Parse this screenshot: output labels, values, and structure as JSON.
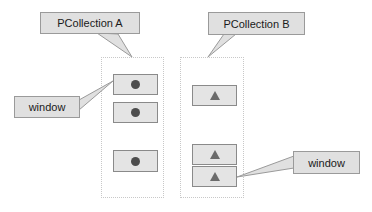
{
  "diagram": {
    "colors": {
      "callout_fill": "#e0e0e0",
      "callout_stroke": "#9a9a9a",
      "element_fill": "#e4e4e4",
      "element_stroke": "#8a8a8a",
      "container_stroke": "#c8c8c8",
      "circle_fill": "#4d4d4d",
      "triangle_fill": "#6b6b6b",
      "background": "#ffffff"
    },
    "callouts": [
      {
        "id": "pcollection-a",
        "label": "PCollection A"
      },
      {
        "id": "pcollection-b",
        "label": "PCollection B"
      },
      {
        "id": "window-left",
        "label": "window"
      },
      {
        "id": "window-right",
        "label": "window"
      }
    ],
    "collections": [
      {
        "id": "pcollection-a",
        "label": "PCollection A",
        "shape": "circle",
        "element_count": 3
      },
      {
        "id": "pcollection-b",
        "label": "PCollection B",
        "shape": "triangle",
        "element_count": 3
      }
    ]
  }
}
